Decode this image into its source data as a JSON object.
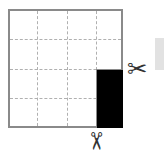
{
  "diagram": {
    "grid": {
      "rows": 4,
      "cols": 4,
      "line_style": "dashed",
      "border_color": "#8a8a8a"
    },
    "shaded_region": {
      "color": "#000000",
      "col": 4,
      "rows": [
        3,
        4
      ]
    },
    "icons": {
      "right_cut": "scissors-icon",
      "bottom_cut": "scissors-icon",
      "right_glyph": "✂",
      "bottom_glyph": "✂"
    }
  }
}
